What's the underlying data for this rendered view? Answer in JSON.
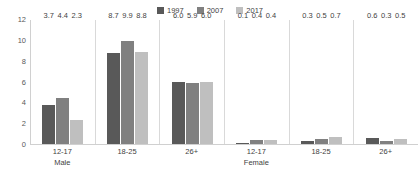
{
  "chart_data": {
    "type": "bar",
    "title": "",
    "subtitle": "",
    "xlabel": "",
    "ylabel": "",
    "ylim": [
      0,
      12
    ],
    "yticks": [
      0,
      2,
      4,
      6,
      8,
      10,
      12
    ],
    "grid": false,
    "legend_position": "top-center",
    "categories": [
      "12-17",
      "18-25",
      "26+",
      "12-17",
      "18-25",
      "26+"
    ],
    "group_labels": [
      "Male",
      "",
      "",
      "Female",
      "",
      ""
    ],
    "series": [
      {
        "name": "1997",
        "color": "#595959",
        "values": [
          3.7,
          8.7,
          6.0,
          0.1,
          0.3,
          0.6
        ]
      },
      {
        "name": "2007",
        "color": "#808080",
        "values": [
          4.4,
          9.9,
          5.9,
          0.4,
          0.5,
          0.3
        ]
      },
      {
        "name": "2017",
        "color": "#bfbfbf",
        "values": [
          2.3,
          8.8,
          6.0,
          0.4,
          0.7,
          0.5
        ]
      }
    ],
    "value_labels": [
      [
        "3.7",
        "4.4",
        "2.3"
      ],
      [
        "8.7",
        "9.9",
        "8.8"
      ],
      [
        "6.0",
        "5.9",
        "6.0"
      ],
      [
        "0.1",
        "0.4",
        "0.4"
      ],
      [
        "0.3",
        "0.5",
        "0.7"
      ],
      [
        "0.6",
        "0.3",
        "0.5"
      ]
    ],
    "ytick_labels": [
      "0",
      "2",
      "4",
      "6",
      "8",
      "10",
      "12"
    ]
  }
}
